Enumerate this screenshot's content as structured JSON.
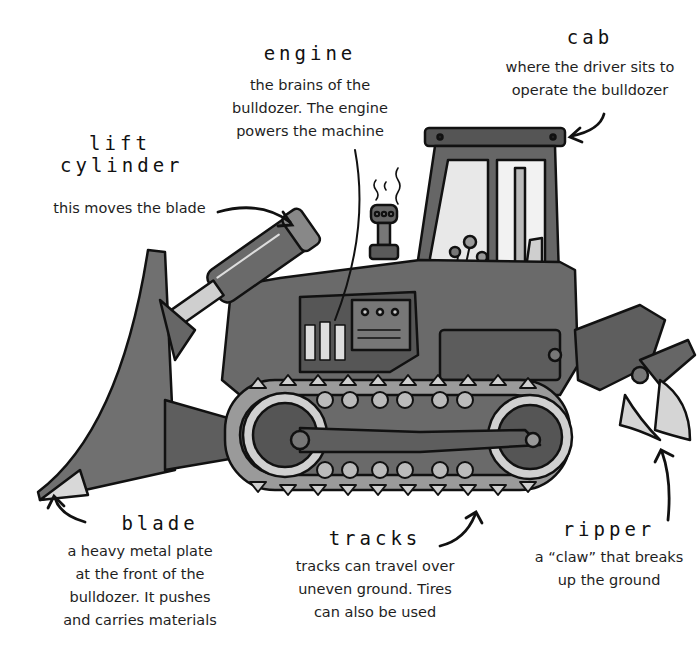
{
  "diagram": {
    "subject": "bulldozer",
    "labels": {
      "engine": {
        "title": "engine",
        "desc_lines": [
          "the brains of the",
          "bulldozer. The engine",
          "powers the machine"
        ]
      },
      "cab": {
        "title": "cab",
        "desc_lines": [
          "where the driver sits to",
          "operate the bulldozer"
        ]
      },
      "lift_cylinder": {
        "title_lines": [
          "lift",
          "cylinder"
        ],
        "desc_lines": [
          "this moves the blade"
        ]
      },
      "blade": {
        "title": "blade",
        "desc_lines": [
          "a heavy metal plate",
          "at the front of the",
          "bulldozer. It pushes",
          "and carries materials"
        ]
      },
      "tracks": {
        "title": "tracks",
        "desc_lines": [
          "tracks can travel over",
          "uneven ground. Tires",
          "can also be used"
        ]
      },
      "ripper": {
        "title": "ripper",
        "desc_lines": [
          "a “claw” that breaks",
          "up the ground"
        ]
      }
    },
    "colors": {
      "body": "#6e6e6e",
      "body_dark": "#4a4a4a",
      "metal_light": "#c8c8c8",
      "outline": "#111111",
      "background": "#ffffff"
    }
  }
}
